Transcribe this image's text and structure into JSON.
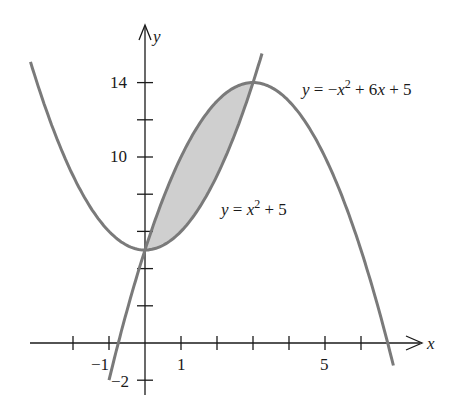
{
  "figure": {
    "type": "region-between-curves",
    "axes": {
      "x_label": "x",
      "y_label": "y",
      "x_ticks": [
        -2,
        -1,
        0,
        1,
        2,
        3,
        4,
        5,
        6
      ],
      "x_tick_labels": [
        {
          "value": -1,
          "text": "−1"
        },
        {
          "value": 1,
          "text": "1"
        },
        {
          "value": 5,
          "text": "5"
        }
      ],
      "y_ticks": [
        -2,
        2,
        4,
        6,
        8,
        10,
        12,
        14
      ],
      "y_tick_labels": [
        {
          "value": 14,
          "text": "14"
        },
        {
          "value": 10,
          "text": "10"
        },
        {
          "value": -2,
          "text": "−2"
        }
      ]
    },
    "curves": [
      {
        "name": "upper-curve",
        "equation": "y = −x² + 6x + 5",
        "label_parts": {
          "y": "y",
          "eq": " = −",
          "x": "x",
          "sup": "2",
          "rest": " + 6",
          "x2": "x",
          "tail": " + 5"
        }
      },
      {
        "name": "lower-curve",
        "equation": "y = x² + 5",
        "label_parts": {
          "y": "y",
          "eq": " = ",
          "x": "x",
          "sup": "2",
          "tail": " + 5"
        }
      }
    ],
    "shaded_region": {
      "from_x": 0,
      "to_x": 3,
      "intersections": [
        [
          0,
          5
        ],
        [
          3,
          14
        ]
      ]
    },
    "colors": {
      "curve": "#7a7a7a",
      "shade": "#cfcfcf",
      "axis": "#1a1a1a",
      "background": "#ffffff"
    }
  }
}
